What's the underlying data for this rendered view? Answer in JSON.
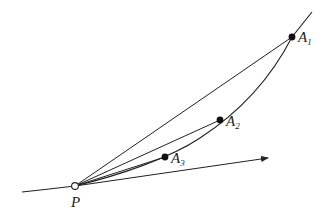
{
  "diagram": {
    "curve": {
      "path": "M 22 192 Q 50 189 75 186 C 120 175 170 158 200 138 C 240 112 270 80 292 37 L 312 12"
    },
    "points": [
      {
        "id": "P",
        "label": "P",
        "subscript": "",
        "x": 75,
        "y": 186,
        "style": "hollow",
        "label_x": 71,
        "label_y": 207
      },
      {
        "id": "A1",
        "label": "A",
        "subscript": "1",
        "x": 292,
        "y": 37,
        "style": "filled",
        "label_x": 298,
        "label_y": 42
      },
      {
        "id": "A2",
        "label": "A",
        "subscript": "2",
        "x": 220,
        "y": 120,
        "style": "filled",
        "label_x": 226,
        "label_y": 126
      },
      {
        "id": "A3",
        "label": "A",
        "subscript": "3",
        "x": 165,
        "y": 157,
        "style": "filled",
        "label_x": 171,
        "label_y": 163
      }
    ],
    "secants": [
      {
        "from": "P",
        "to": "A1"
      },
      {
        "from": "P",
        "to": "A2"
      },
      {
        "from": "P",
        "to": "A3"
      }
    ],
    "tangent_arrow": {
      "from_x": 75,
      "from_y": 186,
      "to_x": 268,
      "to_y": 158
    },
    "colors": {
      "stroke": "#222222",
      "background": "#ffffff"
    }
  }
}
